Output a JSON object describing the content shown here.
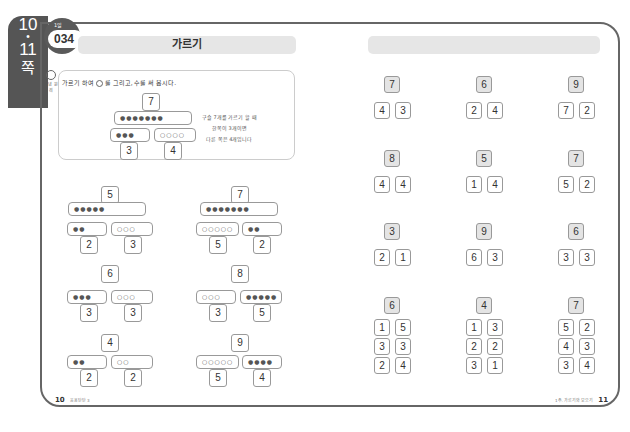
{
  "side_tab": {
    "page_top": "10",
    "dot": "•",
    "page_bottom": "11",
    "unit": "쪽"
  },
  "badge": {
    "label": "1일",
    "number": "034"
  },
  "left_page": {
    "title": "가르기",
    "icon_label": "개념 원리",
    "instruction": [
      "가르기 하여",
      "를 그리고, 수를 써 봅시다."
    ],
    "example": {
      "total": "7",
      "whole_marbles": "●●●●●●●",
      "left_marbles": "●●●",
      "right_marbles": "○○○○",
      "left": "3",
      "right": "4",
      "note": [
        "구슬 7개를 가르기 할 때",
        "한쪽이 3개이면",
        "다른 쪽은 4개입니다"
      ]
    },
    "problems": [
      {
        "total": "5",
        "whole": "●●●●●",
        "left_m": "●●",
        "right_m": "○○○",
        "left": "2",
        "right": "3"
      },
      {
        "total": "7",
        "whole": "●●●●●●●",
        "left_m": "○○○○○",
        "right_m": "●●",
        "left": "5",
        "right": "2"
      },
      {
        "total": "6",
        "whole": "",
        "left_m": "●●●",
        "right_m": "○○○",
        "left": "3",
        "right": "3"
      },
      {
        "total": "8",
        "whole": "",
        "left_m": "○○○",
        "right_m": "●●●●●",
        "left": "3",
        "right": "5"
      },
      {
        "total": "4",
        "whole": "",
        "left_m": "●●",
        "right_m": "○○",
        "left": "2",
        "right": "2"
      },
      {
        "total": "9",
        "whole": "",
        "left_m": "○○○○○",
        "right_m": "●●●●",
        "left": "5",
        "right": "4"
      }
    ],
    "footer": {
      "page": "10",
      "text": "응용탄탄 3"
    }
  },
  "right_page": {
    "problems": [
      {
        "total": "7",
        "parts": [
          [
            "4",
            "3"
          ]
        ]
      },
      {
        "total": "6",
        "parts": [
          [
            "2",
            "4"
          ]
        ]
      },
      {
        "total": "9",
        "parts": [
          [
            "7",
            "2"
          ]
        ]
      },
      {
        "total": "8",
        "parts": [
          [
            "4",
            "4"
          ]
        ]
      },
      {
        "total": "5",
        "parts": [
          [
            "1",
            "4"
          ]
        ]
      },
      {
        "total": "7",
        "parts": [
          [
            "5",
            "2"
          ]
        ]
      },
      {
        "total": "3",
        "parts": [
          [
            "2",
            "1"
          ]
        ]
      },
      {
        "total": "9",
        "parts": [
          [
            "6",
            "3"
          ]
        ]
      },
      {
        "total": "6",
        "parts": [
          [
            "3",
            "3"
          ]
        ]
      },
      {
        "total": "6",
        "parts": [
          [
            "1",
            "5"
          ],
          [
            "3",
            "3"
          ],
          [
            "2",
            "4"
          ]
        ]
      },
      {
        "total": "4",
        "parts": [
          [
            "1",
            "3"
          ],
          [
            "2",
            "2"
          ],
          [
            "3",
            "1"
          ]
        ]
      },
      {
        "total": "7",
        "parts": [
          [
            "5",
            "2"
          ],
          [
            "4",
            "3"
          ],
          [
            "3",
            "4"
          ]
        ]
      }
    ],
    "footer": {
      "page": "11",
      "text": "1주. 가르기와 모으기"
    }
  }
}
